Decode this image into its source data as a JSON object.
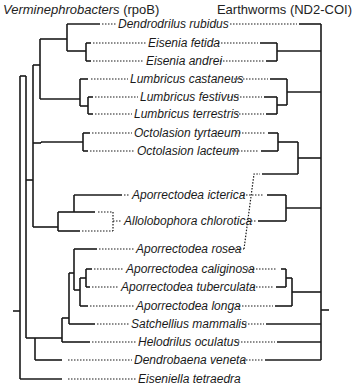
{
  "header": {
    "left_title_italic": "Verminephrobacters",
    "left_title_suffix": " (rpoB)",
    "right_title": "Earthworms (ND2-COI)"
  },
  "colors": {
    "line": "#1a1a1a",
    "background": "#ffffff"
  },
  "taxa": [
    {
      "name": "Dendrodrilus rubidus",
      "y": 24,
      "x": 118
    },
    {
      "name": "Eisenia fetida",
      "y": 43,
      "x": 148
    },
    {
      "name": "Eisenia andrei",
      "y": 61,
      "x": 146
    },
    {
      "name": "Lumbricus castaneus",
      "y": 79,
      "x": 130
    },
    {
      "name": "Lumbricus festivus",
      "y": 97,
      "x": 140
    },
    {
      "name": "Lumbricus terrestris",
      "y": 114,
      "x": 134
    },
    {
      "name": "Octolasion tyrtaeum",
      "y": 133,
      "x": 134
    },
    {
      "name": "Octolasion lacteum",
      "y": 151,
      "x": 137
    },
    {
      "name": "Aporrectodea icterica",
      "y": 195,
      "x": 132
    },
    {
      "name": "Allolobophora chlorotica",
      "y": 221,
      "x": 124
    },
    {
      "name": "Aporrectodea rosea",
      "y": 249,
      "x": 136
    },
    {
      "name": "Aporrectodea caliginosa",
      "y": 269,
      "x": 126
    },
    {
      "name": "Aporrectodea tuberculata",
      "y": 287,
      "x": 121
    },
    {
      "name": "Aporrectodea longa",
      "y": 306,
      "x": 136
    },
    {
      "name": "Satchellius mammalis",
      "y": 324,
      "x": 131
    },
    {
      "name": "Helodrilus oculatus",
      "y": 342,
      "x": 138
    },
    {
      "name": "Dendrobaena veneta",
      "y": 360,
      "x": 134
    },
    {
      "name": "Eiseniella tetraedra",
      "y": 379,
      "x": 138
    }
  ]
}
